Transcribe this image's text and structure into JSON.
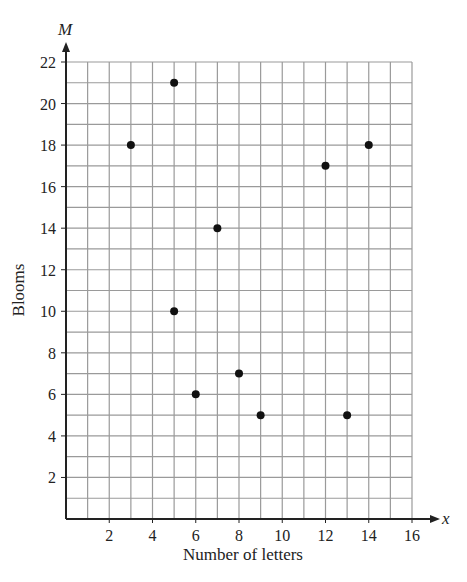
{
  "chart_data": {
    "type": "scatter",
    "title": "",
    "xlabel": "Number of letters",
    "ylabel": "Blooms",
    "x_axis_variable": "x",
    "y_axis_variable": "M",
    "xlim": [
      0,
      16
    ],
    "ylim": [
      0,
      22
    ],
    "x_ticks": [
      2,
      4,
      6,
      8,
      10,
      12,
      14,
      16
    ],
    "y_ticks": [
      2,
      4,
      6,
      8,
      10,
      12,
      14,
      16,
      18,
      20,
      22
    ],
    "grid": true,
    "grid_step": 1,
    "legend": null,
    "series": [
      {
        "name": "points",
        "color": "#111111",
        "points": [
          {
            "x": 3,
            "y": 18
          },
          {
            "x": 5,
            "y": 21
          },
          {
            "x": 5,
            "y": 10
          },
          {
            "x": 6,
            "y": 6
          },
          {
            "x": 7,
            "y": 14
          },
          {
            "x": 8,
            "y": 7
          },
          {
            "x": 9,
            "y": 5
          },
          {
            "x": 12,
            "y": 17
          },
          {
            "x": 13,
            "y": 5
          },
          {
            "x": 14,
            "y": 18
          }
        ]
      }
    ]
  }
}
